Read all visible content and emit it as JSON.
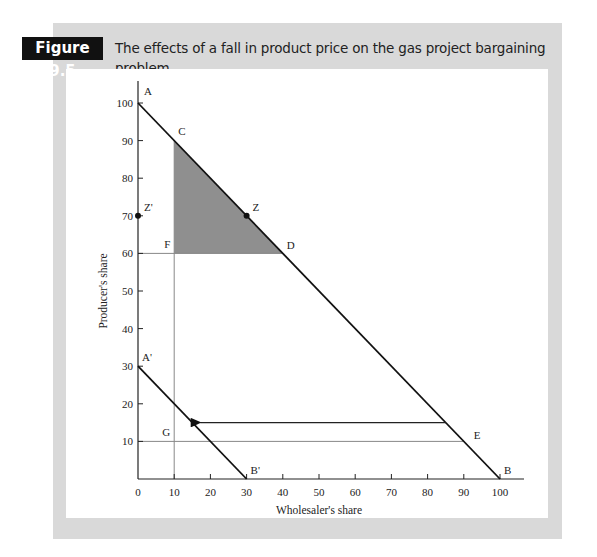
{
  "figure": {
    "badge": "Figure 9.5",
    "title": "The effects of a fall in product price on the gas project bargaining problem"
  },
  "colors": {
    "frame": "#d9d9d9",
    "badge_bg": "#111111",
    "shaded_region": "#8f8f8f",
    "line": "#111111",
    "guide": "#888888"
  },
  "chart_data": {
    "type": "line",
    "title": "The effects of a fall in product price on the gas project bargaining problem",
    "xlabel": "Wholesaler's share",
    "ylabel": "Producer's share",
    "xlim": [
      0,
      100
    ],
    "ylim": [
      0,
      100
    ],
    "x_ticks": [
      "0",
      "10",
      "20",
      "30",
      "40",
      "50",
      "60",
      "70",
      "80",
      "90",
      "100"
    ],
    "y_ticks": [
      "10",
      "20",
      "30",
      "40",
      "50",
      "60",
      "70",
      "80",
      "90",
      "100"
    ],
    "grid": false,
    "series": [
      {
        "name": "AB",
        "points": [
          [
            0,
            100
          ],
          [
            100,
            0
          ]
        ]
      },
      {
        "name": "A'B'",
        "points": [
          [
            0,
            30
          ],
          [
            30,
            0
          ]
        ]
      }
    ],
    "guide_lines": [
      {
        "name": "FD",
        "points": [
          [
            0,
            60
          ],
          [
            40,
            60
          ]
        ]
      },
      {
        "name": "vertical x=10",
        "points": [
          [
            10,
            0
          ],
          [
            10,
            90
          ]
        ]
      },
      {
        "name": "GE",
        "points": [
          [
            0,
            10
          ],
          [
            90,
            10
          ]
        ]
      }
    ],
    "arrow": {
      "from": [
        85,
        15
      ],
      "to": [
        15,
        15
      ]
    },
    "shaded_region": {
      "vertices": [
        [
          10,
          90
        ],
        [
          10,
          60
        ],
        [
          40,
          60
        ]
      ],
      "label": "CFD"
    },
    "points": [
      {
        "label": "Z",
        "x": 30,
        "y": 70,
        "marker": true
      },
      {
        "label": "Z'",
        "x": 0,
        "y": 70,
        "marker": true
      }
    ],
    "labels": [
      {
        "text": "A",
        "x": 0,
        "y": 100
      },
      {
        "text": "B",
        "x": 100,
        "y": 0
      },
      {
        "text": "C",
        "x": 10,
        "y": 90
      },
      {
        "text": "D",
        "x": 40,
        "y": 60
      },
      {
        "text": "E",
        "x": 90,
        "y": 10
      },
      {
        "text": "F",
        "x": 10,
        "y": 60
      },
      {
        "text": "G",
        "x": 10,
        "y": 10
      },
      {
        "text": "A'",
        "x": 0,
        "y": 30
      },
      {
        "text": "B'",
        "x": 30,
        "y": 0
      }
    ]
  }
}
